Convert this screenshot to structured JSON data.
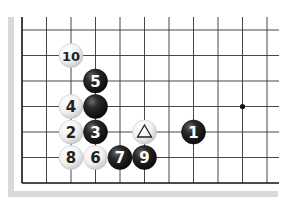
{
  "diagram": {
    "type": "go-board-fragment",
    "grid": {
      "columns_x": [
        22,
        46.5,
        71,
        95.5,
        120,
        144.5,
        169,
        193.5,
        218,
        242.5,
        267
      ],
      "rows_y": [
        30,
        55.5,
        81,
        106.5,
        132,
        157.5,
        183
      ],
      "right_edge_x": 279,
      "top_edge_y": 17,
      "line_color": "#333333",
      "edge_line_color": "#111111"
    },
    "star_points": [
      {
        "col": 9,
        "row": 3
      }
    ],
    "stones": [
      {
        "col": 2,
        "row": 1,
        "color": "white",
        "label": "10"
      },
      {
        "col": 3,
        "row": 2,
        "color": "black",
        "label": "5"
      },
      {
        "col": 2,
        "row": 3,
        "color": "white",
        "label": "4"
      },
      {
        "col": 3,
        "row": 3,
        "color": "black",
        "label": ""
      },
      {
        "col": 2,
        "row": 4,
        "color": "white",
        "label": "2"
      },
      {
        "col": 3,
        "row": 4,
        "color": "black",
        "label": "3"
      },
      {
        "col": 5,
        "row": 4,
        "color": "white",
        "label": "",
        "marker": "triangle"
      },
      {
        "col": 7,
        "row": 4,
        "color": "black",
        "label": "1"
      },
      {
        "col": 2,
        "row": 5,
        "color": "white",
        "label": "8"
      },
      {
        "col": 3,
        "row": 5,
        "color": "white",
        "label": "6"
      },
      {
        "col": 4,
        "row": 5,
        "color": "black",
        "label": "7"
      },
      {
        "col": 5,
        "row": 5,
        "color": "black",
        "label": "9"
      }
    ],
    "colors": {
      "black_stone": "#1a1a1a",
      "white_stone": "#f2f2f2",
      "shadow": "#d9d9d9"
    }
  }
}
